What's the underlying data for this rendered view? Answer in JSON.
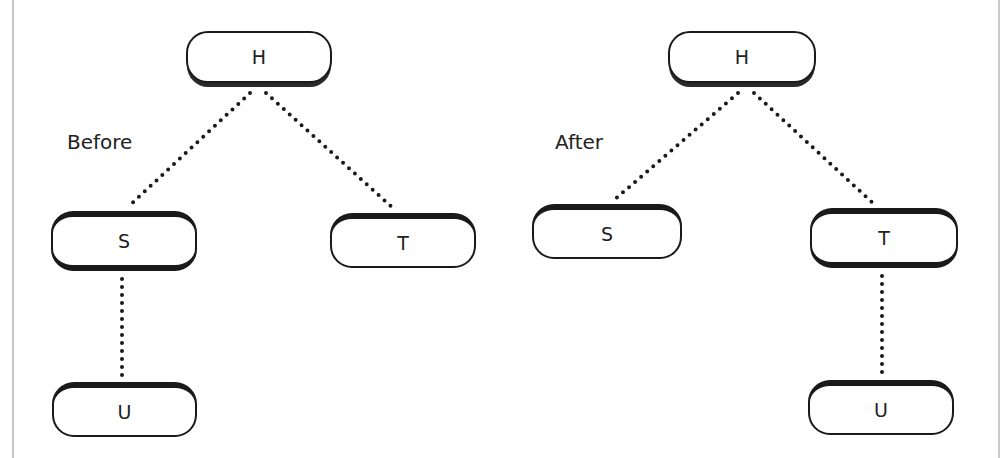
{
  "diagrams": [
    {
      "caption": "Before",
      "nodes": {
        "h": "H",
        "s": "S",
        "t": "T",
        "u": "U"
      },
      "edges": [
        [
          "H",
          "S"
        ],
        [
          "H",
          "T"
        ],
        [
          "S",
          "U"
        ]
      ]
    },
    {
      "caption": "After",
      "nodes": {
        "h": "H",
        "s": "S",
        "t": "T",
        "u": "U"
      },
      "edges": [
        [
          "H",
          "S"
        ],
        [
          "H",
          "T"
        ],
        [
          "T",
          "U"
        ]
      ]
    }
  ],
  "style": {
    "line": "#1a1a1a",
    "edge_style": "dotted",
    "frame": "#c8c8c8"
  }
}
